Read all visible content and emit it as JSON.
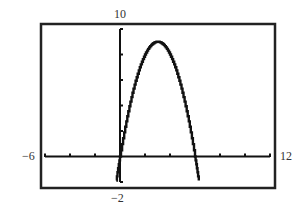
{
  "chart_data": {
    "type": "line",
    "title": "",
    "xlabel": "",
    "ylabel": "",
    "function": "y = -x^2 + 6x",
    "window": {
      "xmin": -6,
      "xmax": 12,
      "xscl": 2,
      "ymin": -2,
      "ymax": 10,
      "yscl": 2
    },
    "xlim": [
      -6,
      12
    ],
    "ylim": [
      -2,
      10
    ],
    "tick_labels": {
      "xmin": "−6",
      "xmax": "12",
      "ymin": "−2",
      "ymax": "10"
    },
    "series": [
      {
        "name": "f(x)",
        "x": [
          -0.3,
          0,
          0.5,
          1,
          1.5,
          2,
          2.5,
          3,
          3.5,
          4,
          4.5,
          5,
          5.5,
          6,
          6.3
        ],
        "values": [
          -1.89,
          0,
          2.75,
          5,
          6.75,
          8,
          8.75,
          9,
          8.75,
          8,
          6.75,
          5,
          2.75,
          0,
          -1.89
        ]
      }
    ],
    "key_points": {
      "vertex": [
        3,
        9
      ],
      "x_intercepts": [
        0,
        6
      ]
    },
    "grid": false,
    "legend": null
  },
  "colors": {
    "axis": "#111111",
    "curve": "#111111",
    "frame": "#222222",
    "background": "#ffffff"
  }
}
